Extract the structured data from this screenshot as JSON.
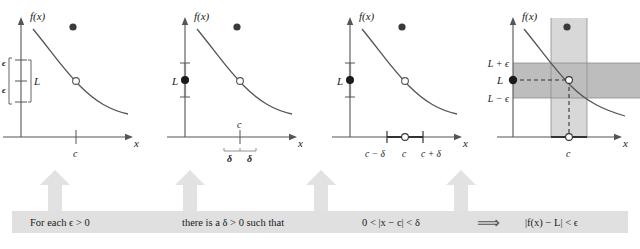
{
  "figure": {
    "type": "diagram",
    "width": 640,
    "height": 249,
    "background": "#ffffff"
  },
  "colors": {
    "axis": "#555555",
    "curve": "#555555",
    "text": "#1a1a1a",
    "arrow_fill": "#e2e2e2",
    "band_horizontal": "#bdbdbd",
    "band_vertical": "#d8d8d8",
    "caption_bar": "#e0e0e0",
    "dot_fill": "#3a3a3a",
    "open_circle_fill": "#ffffff"
  },
  "panels": [
    {
      "id": "panel-1",
      "index": 1,
      "y_axis_label": "f(x)",
      "x_axis_label": "x",
      "x_tick_label": "c",
      "y_labels": [
        "ϵ",
        "ϵ",
        "L"
      ],
      "has_epsilon_bracket": true,
      "has_delta_interval": false,
      "has_shaded_bands": false,
      "has_L_dot": false,
      "open_circle_on_curve": true,
      "floating_dot": true
    },
    {
      "id": "panel-2",
      "index": 2,
      "y_axis_label": "f(x)",
      "x_axis_label": "x",
      "x_tick_label": "c",
      "y_labels": [
        "L"
      ],
      "delta_labels": [
        "δ",
        "δ"
      ],
      "has_epsilon_bracket": false,
      "has_delta_interval": true,
      "has_shaded_bands": false,
      "has_L_dot": true,
      "open_circle_on_curve": true,
      "floating_dot": true
    },
    {
      "id": "panel-3",
      "index": 3,
      "y_axis_label": "f(x)",
      "x_axis_label": "x",
      "x_tick_labels": [
        "c − δ",
        "c",
        "c + δ"
      ],
      "y_labels": [
        "L"
      ],
      "has_epsilon_bracket": false,
      "has_delta_interval": true,
      "has_shaded_bands": false,
      "has_L_dot": true,
      "open_circle_on_curve": true,
      "open_circle_on_axis": true,
      "floating_dot": true
    },
    {
      "id": "panel-4",
      "index": 4,
      "y_axis_label": "f(x)",
      "x_axis_label": "x",
      "x_tick_label": "c",
      "y_labels": [
        "L + ϵ",
        "L",
        "L − ϵ"
      ],
      "has_epsilon_bracket": false,
      "has_delta_interval": true,
      "has_shaded_bands": true,
      "has_L_dot": true,
      "open_circle_on_curve": true,
      "open_circle_on_axis": true,
      "floating_dot": true,
      "dashed_guides": true
    }
  ],
  "caption": {
    "segments": [
      {
        "id": "caption-1",
        "text": "For each  ϵ > 0"
      },
      {
        "id": "caption-2",
        "text": "there is a  δ > 0 such that"
      },
      {
        "id": "caption-3",
        "text": "0 < |x − c| < δ"
      },
      {
        "id": "caption-4",
        "text": "⟹"
      },
      {
        "id": "caption-5",
        "text": "|f(x) − L| < ϵ"
      }
    ]
  },
  "arrows": {
    "count": 4,
    "direction": "up",
    "label": "connector-arrow"
  }
}
